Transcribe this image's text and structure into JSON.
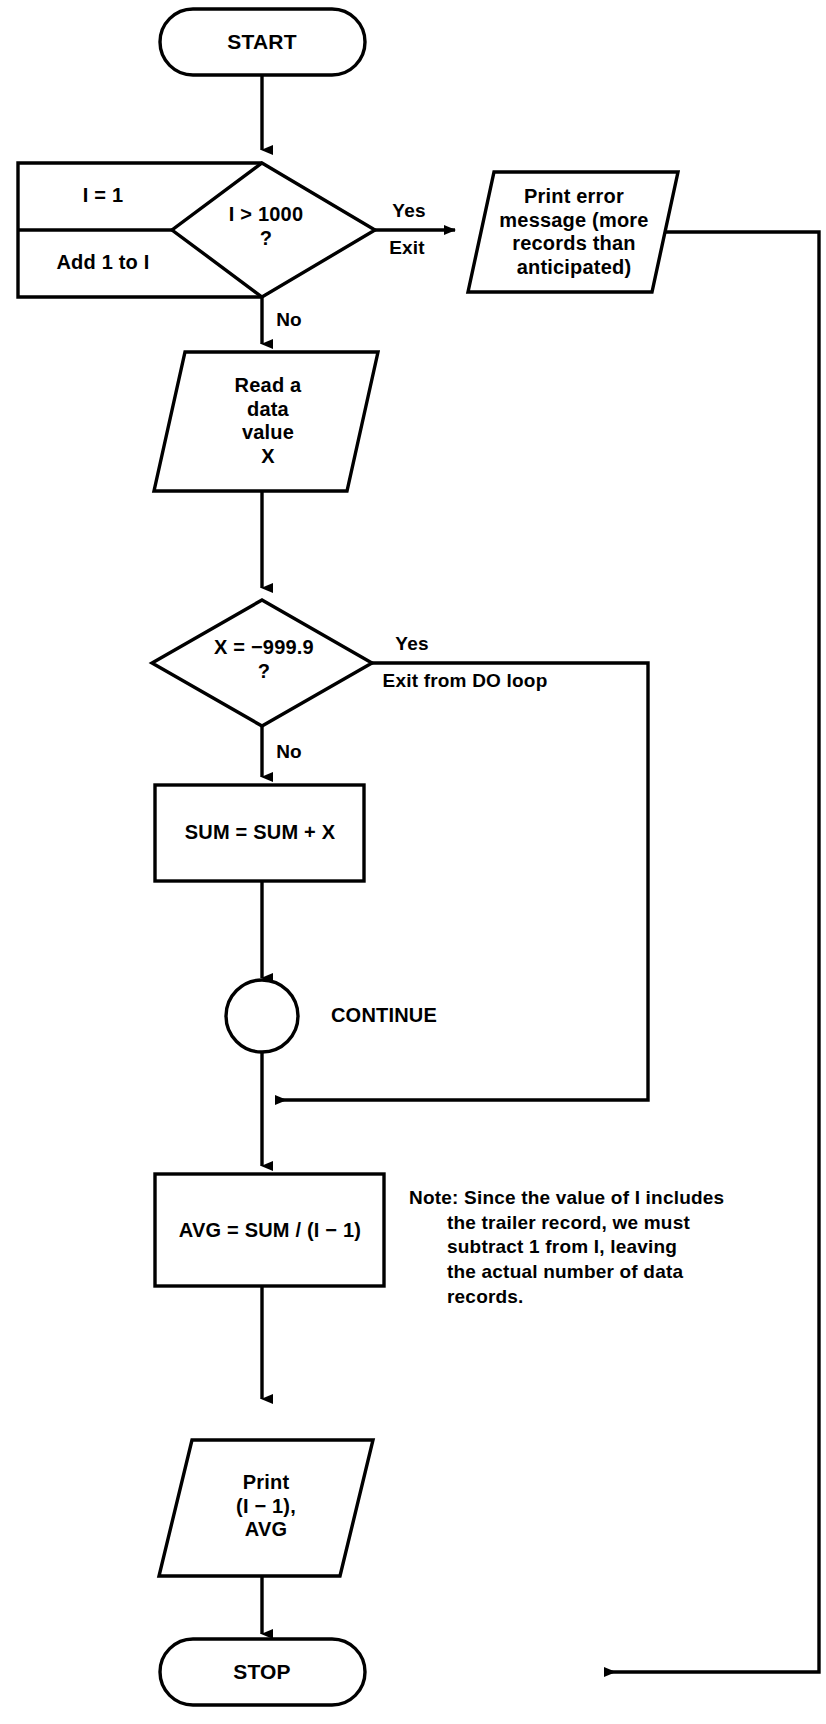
{
  "diagram": {
    "type": "flowchart",
    "stroke_color": "#000000",
    "background_color": "#ffffff",
    "nodes": {
      "start": {
        "shape": "terminator",
        "label": "START"
      },
      "init": {
        "shape": "process",
        "label": "I = 1"
      },
      "increment": {
        "shape": "process",
        "label": "Add 1 to I"
      },
      "loop_test": {
        "shape": "decision",
        "label": "I > 1000\n?"
      },
      "print_error": {
        "shape": "input-output",
        "label": "Print error\nmessage (more\nrecords than\nanticipated)"
      },
      "read_data": {
        "shape": "input-output",
        "label": "Read a\ndata\nvalue\nX"
      },
      "trailer_test": {
        "shape": "decision",
        "label": "X = −999.9\n?"
      },
      "accumulate": {
        "shape": "process",
        "label": "SUM = SUM + X"
      },
      "continue": {
        "shape": "connector",
        "label": "CONTINUE"
      },
      "average": {
        "shape": "process",
        "label": "AVG = SUM / (I − 1)"
      },
      "print_results": {
        "shape": "input-output",
        "label": "Print\n(I − 1),\nAVG"
      },
      "stop": {
        "shape": "terminator",
        "label": "STOP"
      }
    },
    "edge_labels": {
      "loop_yes": "Yes",
      "loop_exit": "Exit",
      "loop_no": "No",
      "trailer_yes": "Yes",
      "trailer_exit": "Exit from DO loop",
      "trailer_no": "No"
    },
    "note": {
      "prefix": "Note:",
      "lines": [
        "Note: Since the value of I includes",
        "the trailer record, we must",
        "subtract 1 from I, leaving",
        "the actual number of data",
        "records."
      ],
      "text": "Note: Since the value of I includes the trailer record, we must subtract 1 from I, leaving the actual number of data records."
    }
  }
}
